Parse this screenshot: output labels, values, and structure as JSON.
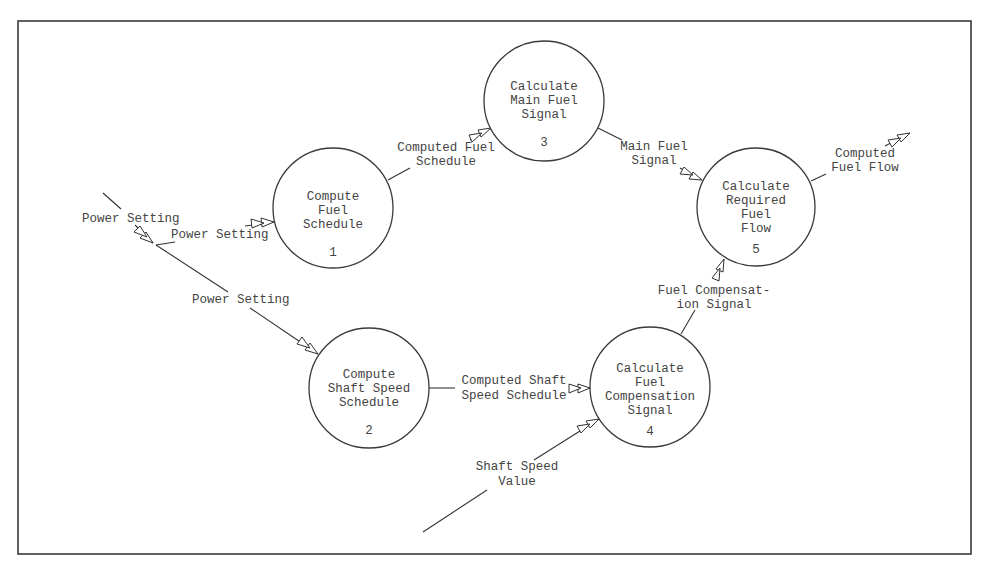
{
  "diagram": {
    "type": "data-flow-diagram",
    "processes": [
      {
        "id": "1",
        "number": "1",
        "lines": [
          "Compute",
          "Fuel",
          "Schedule"
        ]
      },
      {
        "id": "2",
        "number": "2",
        "lines": [
          "Compute",
          "Shaft Speed",
          "Schedule"
        ]
      },
      {
        "id": "3",
        "number": "3",
        "lines": [
          "Calculate",
          "Main Fuel",
          "Signal"
        ]
      },
      {
        "id": "4",
        "number": "4",
        "lines": [
          "Calculate",
          "Fuel",
          "Compensation",
          "Signal"
        ]
      },
      {
        "id": "5",
        "number": "5",
        "lines": [
          "Calculate",
          "Required",
          "Fuel",
          "Flow"
        ]
      }
    ],
    "flows": [
      {
        "label_lines": [
          "Power Setting"
        ],
        "from": "external",
        "to": "split"
      },
      {
        "label_lines": [
          "Power Setting"
        ],
        "from": "split",
        "to": "1"
      },
      {
        "label_lines": [
          "Power Setting"
        ],
        "from": "split",
        "to": "2"
      },
      {
        "label_lines": [
          "Computed Fuel",
          "Schedule"
        ],
        "from": "1",
        "to": "3"
      },
      {
        "label_lines": [
          "Main Fuel",
          "Signal"
        ],
        "from": "3",
        "to": "5"
      },
      {
        "label_lines": [
          "Computed Shaft",
          "Speed Schedule"
        ],
        "from": "2",
        "to": "4"
      },
      {
        "label_lines": [
          "Shaft Speed",
          "Value"
        ],
        "from": "external",
        "to": "4"
      },
      {
        "label_lines": [
          "Fuel Compensat-",
          "ion Signal"
        ],
        "from": "4",
        "to": "5"
      },
      {
        "label_lines": [
          "Computed",
          "Fuel Flow"
        ],
        "from": "5",
        "to": "external"
      }
    ]
  }
}
